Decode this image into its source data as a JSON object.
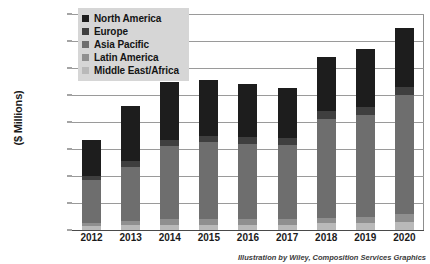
{
  "chart_data": {
    "type": "bar",
    "stacked": true,
    "title": "",
    "xlabel": "",
    "ylabel": "($ Millions)",
    "ylim": [
      0,
      80000
    ],
    "ytick_step": 10000,
    "ytick_labels": [
      "$80,000",
      "$70,000",
      "$60,000",
      "$50,000",
      "$40,000",
      "$30,000",
      "$20,000",
      "$10,000",
      "$-"
    ],
    "ytick_values": [
      80000,
      70000,
      60000,
      50000,
      40000,
      30000,
      20000,
      10000,
      0
    ],
    "grid": true,
    "legend_position": "top-left",
    "categories": [
      "2012",
      "2013",
      "2014",
      "2015",
      "2016",
      "2017",
      "2018",
      "2019",
      "2020"
    ],
    "series": [
      {
        "name": "North America",
        "color": "#1d1d1d",
        "values": [
          13500,
          20500,
          21500,
          20500,
          19500,
          18500,
          20000,
          21500,
          22000
        ]
      },
      {
        "name": "Europe",
        "color": "#3f3f3f",
        "values": [
          1500,
          2000,
          2500,
          2500,
          2500,
          2500,
          3000,
          3000,
          3000
        ]
      },
      {
        "name": "Asia Pacific",
        "color": "#6e6e6e",
        "values": [
          16000,
          20000,
          27000,
          28500,
          28000,
          27500,
          36500,
          37500,
          44000
        ]
      },
      {
        "name": "Latin America",
        "color": "#8f8f8f",
        "values": [
          1000,
          1500,
          2000,
          2000,
          2000,
          2000,
          2000,
          2500,
          3000
        ]
      },
      {
        "name": "Middle East/Africa",
        "color": "#b9b9b9",
        "values": [
          1500,
          2000,
          2000,
          2000,
          2000,
          2000,
          2500,
          2500,
          3000
        ]
      }
    ],
    "totals": [
      33500,
      46000,
      55000,
      55500,
      54000,
      52500,
      64000,
      67000,
      75000
    ]
  },
  "caption": "Illustration by Wiley, Composition Services Graphics"
}
